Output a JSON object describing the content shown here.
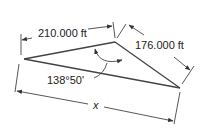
{
  "diagram": {
    "type": "triangle-dimension",
    "side_a_label": "210.000 ft",
    "side_b_label": "176.000 ft",
    "angle_label": "138°50'",
    "unknown_label": "x",
    "line_color": "#333333"
  }
}
